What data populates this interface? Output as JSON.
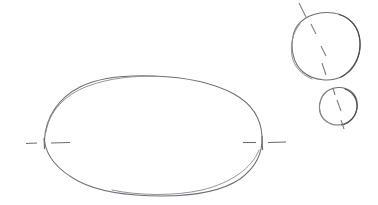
{
  "document": {
    "title": "Hand-drawn geometry sketch",
    "medium": "pencil-on-paper",
    "background_color": "#ffffff",
    "stroke_color": "#6e6e74",
    "stroke_color_dark": "#4e4e56",
    "stroke_color_faint": "#8e8e95",
    "width": 378,
    "height": 205,
    "visible_text": ""
  },
  "shapes": {
    "ellipse": {
      "name": "large-ellipse",
      "cx": 153,
      "cy": 136,
      "rx": 109,
      "ry": 60,
      "left_vertex_x": 44,
      "right_vertex_x": 262,
      "top_y": 76,
      "bottom_y": 196
    },
    "circle_large": {
      "name": "upper-right-large-circle",
      "cx": 326,
      "cy": 46,
      "r": 34
    },
    "circle_small": {
      "name": "lower-right-small-circle",
      "cx": 338,
      "cy": 106,
      "r": 19
    }
  },
  "markers": {
    "ellipse_left_centerline": {
      "y": 143,
      "dash_a": [
        26,
        37
      ],
      "tick_x": 44,
      "tick_top": 138,
      "tick_bottom": 149,
      "dash_b": [
        51,
        70
      ]
    },
    "ellipse_right_centerline": {
      "y": 143,
      "dash_a": [
        243,
        256
      ],
      "tick_x": 262,
      "tick_top": 136,
      "tick_bottom": 150,
      "dash_b": [
        268,
        286
      ]
    },
    "circle_large_axis": {
      "angle_label": "diagonal",
      "segments": [
        [
          299,
          3,
          306,
          17
        ],
        [
          311,
          24,
          316,
          34
        ],
        [
          321,
          46,
          326,
          56
        ],
        [
          322,
          63,
          326,
          75
        ]
      ]
    },
    "circle_small_axis": {
      "angle_label": "diagonal",
      "segments": [
        [
          333,
          88,
          335,
          95
        ],
        [
          337,
          100,
          341,
          111
        ],
        [
          341,
          120,
          344,
          129
        ]
      ]
    }
  }
}
